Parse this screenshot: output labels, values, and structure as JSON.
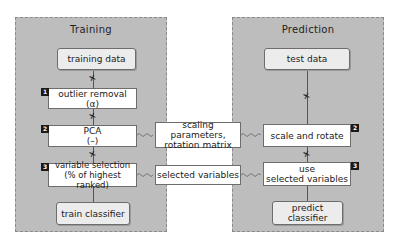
{
  "training": {
    "title": "Training",
    "steps": {
      "data": "training data",
      "outlier_line1": "outlier removal",
      "outlier_line2": "(α)",
      "pca_line1": "PCA",
      "pca_line2": "(–)",
      "varsel_line1": "variable selection",
      "varsel_line2": "(% of highest ranked)",
      "classifier": "train classifier"
    },
    "badges": [
      "1",
      "2",
      "3"
    ]
  },
  "prediction": {
    "title": "Prediction",
    "steps": {
      "data": "test data",
      "scale": "scale and rotate",
      "use_line1": "use",
      "use_line2": "selected variables",
      "classifier": "predict classifier"
    },
    "badges": [
      "2",
      "3"
    ]
  },
  "transfer": {
    "params_line1": "scaling parameters,",
    "params_line2": "rotation matrix",
    "variables": "selected variables"
  },
  "colors": {
    "panel": "#bdbdbd",
    "badge": "#1a1a1a",
    "data_box": "#ececec"
  }
}
